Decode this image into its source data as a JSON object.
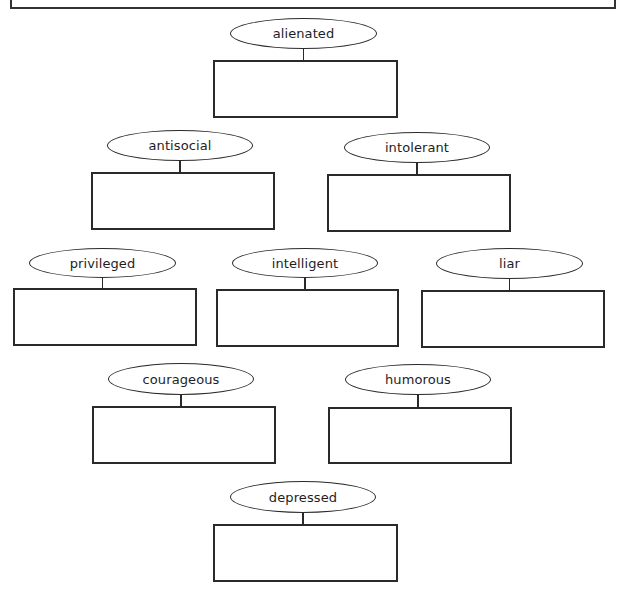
{
  "diagram": {
    "type": "character-trait-organizer",
    "top_box": {
      "text": ""
    },
    "nodes": [
      {
        "id": "alienated",
        "label": "alienated",
        "answer": "",
        "row": 1,
        "ellipse": {
          "x": 230,
          "y": 18,
          "w": 147,
          "h": 31
        },
        "box": {
          "x": 213,
          "y": 60,
          "w": 185,
          "h": 58
        }
      },
      {
        "id": "antisocial",
        "label": "antisocial",
        "answer": "",
        "row": 2,
        "ellipse": {
          "x": 107,
          "y": 130,
          "w": 146,
          "h": 31
        },
        "box": {
          "x": 91,
          "y": 172,
          "w": 184,
          "h": 58
        }
      },
      {
        "id": "intolerant",
        "label": "intolerant",
        "answer": "",
        "row": 2,
        "ellipse": {
          "x": 344,
          "y": 132,
          "w": 146,
          "h": 31
        },
        "box": {
          "x": 327,
          "y": 174,
          "w": 184,
          "h": 58
        }
      },
      {
        "id": "privileged",
        "label": "privileged",
        "answer": "",
        "row": 3,
        "ellipse": {
          "x": 29,
          "y": 248,
          "w": 147,
          "h": 30
        },
        "box": {
          "x": 13,
          "y": 288,
          "w": 184,
          "h": 58
        }
      },
      {
        "id": "intelligent",
        "label": "intelligent",
        "answer": "",
        "row": 3,
        "ellipse": {
          "x": 232,
          "y": 248,
          "w": 146,
          "h": 30
        },
        "box": {
          "x": 216,
          "y": 289,
          "w": 183,
          "h": 58
        }
      },
      {
        "id": "liar",
        "label": "liar",
        "answer": "",
        "row": 3,
        "ellipse": {
          "x": 436,
          "y": 248,
          "w": 147,
          "h": 31
        },
        "box": {
          "x": 421,
          "y": 290,
          "w": 184,
          "h": 58
        }
      },
      {
        "id": "courageous",
        "label": "courageous",
        "answer": "",
        "row": 4,
        "ellipse": {
          "x": 108,
          "y": 363,
          "w": 146,
          "h": 32
        },
        "box": {
          "x": 92,
          "y": 406,
          "w": 184,
          "h": 58
        }
      },
      {
        "id": "humorous",
        "label": "humorous",
        "answer": "",
        "row": 4,
        "ellipse": {
          "x": 345,
          "y": 364,
          "w": 146,
          "h": 31
        },
        "box": {
          "x": 328,
          "y": 407,
          "w": 184,
          "h": 57
        }
      },
      {
        "id": "depressed",
        "label": "depressed",
        "answer": "",
        "row": 5,
        "ellipse": {
          "x": 230,
          "y": 481,
          "w": 146,
          "h": 32
        },
        "box": {
          "x": 213,
          "y": 524,
          "w": 185,
          "h": 58
        }
      }
    ]
  },
  "colors": {
    "stroke": "#2a2a2a",
    "background": "#ffffff",
    "text": "#1e1e1e"
  }
}
